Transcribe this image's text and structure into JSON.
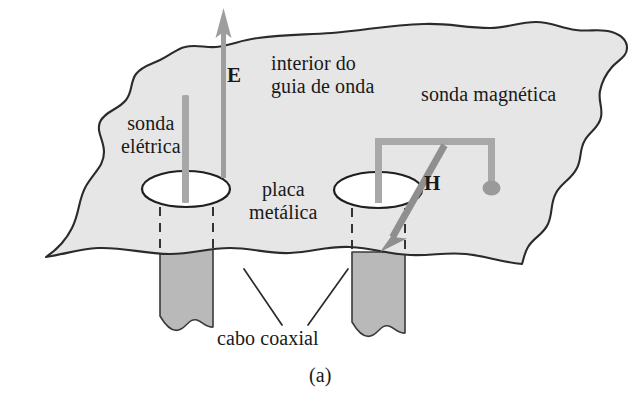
{
  "figure": {
    "caption": "(a)",
    "language": "pt-BR",
    "background_color": "#ffffff",
    "plate_fill": "#e6e6e6",
    "cable_fill": "#b9b9b9",
    "probe_color": "#a8a8a8",
    "outline_color": "#2b2b2b",
    "hole_fill": "#ffffff"
  },
  "labels": {
    "electric_probe": "sonda\nelétrica",
    "waveguide_interior": "interior do\nguia de onda",
    "magnetic_probe": "sonda magnética",
    "metal_plate": "placa\nmetálica",
    "coaxial_cable": "cabo coaxial",
    "field_E": "E",
    "field_H": "H",
    "caption": "(a)"
  },
  "elements": {
    "plate": {
      "name": "metal plate with torn edges",
      "fill": "#e6e6e6",
      "stroke": "#2b2b2b"
    },
    "hole_left": {
      "name": "left aperture ellipse",
      "cx": 180,
      "cy": 190,
      "rx": 40,
      "ry": 16
    },
    "hole_right": {
      "name": "right aperture ellipse",
      "cx": 378,
      "cy": 190,
      "rx": 40,
      "ry": 16
    },
    "electric_probe_rod": {
      "name": "straight vertical rod probe",
      "color": "#a8a8a8"
    },
    "magnetic_probe_loop": {
      "name": "inverted-U loop probe with terminal bead",
      "color": "#a8a8a8"
    },
    "arrow_E": {
      "name": "upward field arrow",
      "direction": "up",
      "color": "#9e9e9e"
    },
    "arrow_H": {
      "name": "diagonal field arrow",
      "direction": "down-left",
      "color": "#8f8f8f"
    },
    "cable_left": {
      "name": "left coaxial cable stub",
      "fill": "#b9b9b9"
    },
    "cable_right": {
      "name": "right coaxial cable stub",
      "fill": "#b9b9b9"
    },
    "dashed_guides": {
      "name": "hidden-edge dashed lines",
      "count": 4,
      "color": "#2b2b2b"
    },
    "leader_lines": {
      "name": "cabo coaxial leader lines",
      "count": 2,
      "color": "#2b2b2b"
    }
  }
}
